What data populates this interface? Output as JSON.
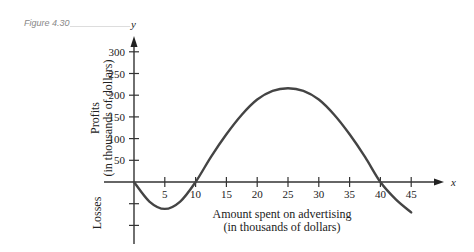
{
  "figure": {
    "label": "Figure 4.30"
  },
  "chart_data": {
    "type": "line",
    "title": "",
    "xlabel": "Amount spent on advertising (in thousands of dollars)",
    "xlabel_lines": [
      "Amount spent on advertising",
      "(in thousands of dollars)"
    ],
    "ylabel": "Profits (in thousands of dollars)",
    "ylabel_lines": [
      "Profits",
      "(in thousands of dollars)"
    ],
    "ylabel_negative": "Losses",
    "x_axis_var": "x",
    "y_axis_var": "y",
    "x_ticks": [
      5,
      10,
      15,
      20,
      25,
      30,
      35,
      40,
      45
    ],
    "y_ticks": [
      50,
      100,
      150,
      200,
      250,
      300
    ],
    "y_neg_ticks": [
      -50,
      -100
    ],
    "xlim": [
      0,
      48
    ],
    "ylim": [
      -120,
      330
    ],
    "grid": false,
    "series": [
      {
        "name": "profit",
        "x": [
          0,
          2.5,
          5,
          7.5,
          10,
          12.5,
          15,
          17.5,
          20,
          22.5,
          25,
          27.5,
          30,
          32.5,
          35,
          37.5,
          40,
          42.5,
          45
        ],
        "y": [
          0,
          -45,
          -62,
          -45,
          0,
          58,
          110,
          155,
          190,
          210,
          216,
          210,
          190,
          155,
          110,
          58,
          0,
          -40,
          -70
        ]
      }
    ]
  }
}
